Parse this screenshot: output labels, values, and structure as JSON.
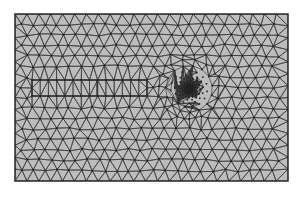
{
  "figure": {
    "title": "Finite element triangular mesh",
    "colors": {
      "background": "#ffffff",
      "domain_fill": "#bdbdbd",
      "mesh_edge": "#3a3a3a",
      "boundary": "#2a2a2a",
      "node": "#222222"
    },
    "domain": {
      "x": 15,
      "y": 14,
      "width": 273,
      "height": 167
    },
    "inclusion": {
      "x": 32,
      "y": 80,
      "width": 115,
      "height": 16,
      "divider_x": 97
    },
    "refinement_point": {
      "x": 189,
      "y": 89,
      "radius": 40
    },
    "base_spacing": 12
  }
}
